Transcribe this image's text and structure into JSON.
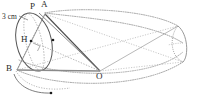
{
  "figure": {
    "type": "geometry-diagram",
    "width": 200,
    "height": 100,
    "background_color": "#ffffff"
  },
  "labels": {
    "dimension": {
      "text": "3 cm",
      "x": 2,
      "y": 13
    },
    "point_p": {
      "text": "P",
      "x": 30,
      "y": 3
    },
    "point_a": {
      "text": "A",
      "x": 41,
      "y": 1
    },
    "point_h": {
      "text": "H",
      "x": 21,
      "y": 36
    },
    "point_b": {
      "text": "B",
      "x": 6,
      "y": 65
    },
    "point_o": {
      "text": "O",
      "x": 97,
      "y": 73
    }
  },
  "colors": {
    "solid_stroke": "#555555",
    "dotted_stroke": "#8d8d8d",
    "base_line": "#8a8a8a",
    "label_text": "#2b2b2b",
    "marker_fill": "#1a1a1a"
  },
  "geometry": {
    "cone_apex": {
      "x": 100,
      "y": 71
    },
    "cone_base_center": {
      "x": 35,
      "y": 42
    },
    "cone_base_rx": 18,
    "cone_base_ry": 30,
    "point_h": {
      "x": 31,
      "y": 41
    },
    "point_a": {
      "x": 45,
      "y": 14
    },
    "point_p": {
      "x": 39,
      "y": 13
    },
    "point_b": {
      "x": 17,
      "y": 70
    },
    "right_cap_center": {
      "x": 167,
      "y": 48
    },
    "right_cap_rx": 16,
    "right_cap_ry": 33,
    "outer_ellipse_cx": 103,
    "outer_ellipse_cy": 48,
    "outer_ellipse_rx": 84,
    "outer_ellipse_ry": 36,
    "lower_arc_marker": {
      "x": 48,
      "y": 93
    },
    "inner_dot": {
      "x": 53,
      "y": 40
    },
    "center_dot": {
      "x": 31,
      "y": 41
    }
  }
}
